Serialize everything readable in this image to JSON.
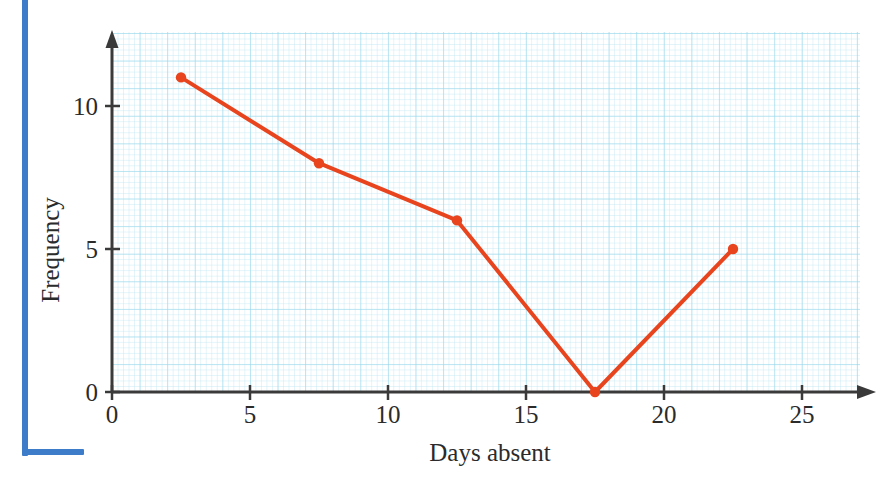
{
  "decor": {
    "rule_color": "#3d7cc9",
    "rule_name": "blue-margin-rule"
  },
  "chart_data": {
    "type": "line",
    "title": "",
    "subtitle": "",
    "xlabel": "Days absent",
    "ylabel": "Frequency",
    "x": [
      2.5,
      7.5,
      12.5,
      17.5,
      22.5
    ],
    "values": [
      11,
      8,
      6,
      0,
      5
    ],
    "series": [
      {
        "name": "Frequency",
        "x": [
          2.5,
          7.5,
          12.5,
          17.5,
          22.5
        ],
        "values": [
          11,
          8,
          6,
          0,
          5
        ],
        "color": "#e8441e",
        "marker": "circle",
        "line_width": 4
      }
    ],
    "xlim": [
      0,
      27.5
    ],
    "ylim": [
      0,
      12.5
    ],
    "xticks": [
      0,
      5,
      10,
      15,
      20,
      25
    ],
    "xtick_labels": [
      "0",
      "5",
      "10",
      "15",
      "20",
      "25"
    ],
    "yticks": [
      0,
      5,
      10
    ],
    "ytick_labels": [
      "0",
      "5",
      "10"
    ],
    "grid": true,
    "grid_style": "graph-paper",
    "grid_color": "#96d7eb",
    "legend": false,
    "legend_position": "none",
    "axis_color": "#3a3a3a",
    "axis_arrows": true,
    "annotations": []
  },
  "axes": {
    "x_ticks": [
      {
        "label": "0",
        "value": 0
      },
      {
        "label": "5",
        "value": 5
      },
      {
        "label": "10",
        "value": 10
      },
      {
        "label": "15",
        "value": 15
      },
      {
        "label": "20",
        "value": 20
      },
      {
        "label": "25",
        "value": 25
      }
    ],
    "y_ticks": [
      {
        "label": "0",
        "value": 0
      },
      {
        "label": "5",
        "value": 5
      },
      {
        "label": "10",
        "value": 10
      }
    ],
    "x_title": "Days absent",
    "y_title": "Frequency"
  }
}
